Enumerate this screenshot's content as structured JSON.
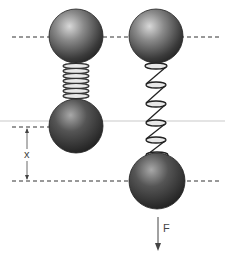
{
  "diagram": {
    "labels": {
      "displacement": "x",
      "force": "F"
    },
    "colors": {
      "ball_dark": "#2a2a2a",
      "ball_mid": "#6a6a6a",
      "ball_light": "#cfcfcf",
      "dashed_line": "#333333",
      "reference_line": "#bbbbbb",
      "coil": "#e8e8e8"
    }
  }
}
